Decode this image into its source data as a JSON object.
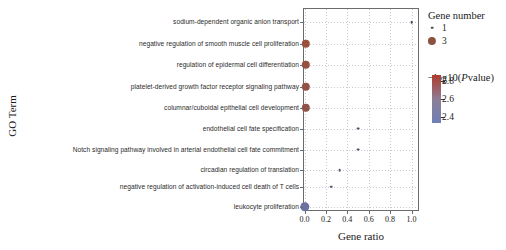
{
  "chart_data": {
    "type": "scatter",
    "title": "",
    "xlabel": "Gene ratio",
    "ylabel": "GO Term",
    "xlim": [
      -0.05,
      1.08
    ],
    "xticks": [
      "0.0",
      "0.2",
      "0.4",
      "0.6",
      "0.8",
      "1.0"
    ],
    "xtickvalues": [
      0.0,
      0.2,
      0.4,
      0.6,
      0.8,
      1.0
    ],
    "grid": true,
    "legend_position": "right",
    "categories": [
      "sodium-dependent organic anion transport",
      "negative regulation of smooth muscle cell proliferation",
      "regulation of epidermal cell differentiation",
      "platelet-derived growth factor receptor signaling pathway",
      "columnar/cuboidal epithelial cell development",
      "endothelial cell fate specification",
      "Notch signaling pathway involved in arterial endothelial cell fate commitment",
      "circadian regulation of translation",
      "negative regulation of activation-induced cell death of T cells",
      "leukocyte proliferation"
    ],
    "points": [
      {
        "category": "sodium-dependent organic anion transport",
        "gene_ratio": 1.0,
        "gene_number": 1,
        "neglog10_pvalue": 2.62,
        "color": "#4a4a55",
        "size": 2.6
      },
      {
        "category": "negative regulation of smooth muscle cell proliferation",
        "gene_ratio": 0.01,
        "gene_number": 3,
        "neglog10_pvalue": 2.8,
        "color": "#9c4f3d",
        "size": 8.4
      },
      {
        "category": "regulation of epidermal cell differentiation",
        "gene_ratio": 0.01,
        "gene_number": 3,
        "neglog10_pvalue": 2.78,
        "color": "#99503f",
        "size": 8.4
      },
      {
        "category": "platelet-derived growth factor receptor signaling pathway",
        "gene_ratio": 0.01,
        "gene_number": 3,
        "neglog10_pvalue": 2.76,
        "color": "#955244",
        "size": 8.4
      },
      {
        "category": "columnar/cuboidal epithelial cell development",
        "gene_ratio": 0.01,
        "gene_number": 3,
        "neglog10_pvalue": 2.74,
        "color": "#8f5349",
        "size": 8.4
      },
      {
        "category": "endothelial cell fate specification",
        "gene_ratio": 0.5,
        "gene_number": 1,
        "neglog10_pvalue": 2.64,
        "color": "#4f4f5e",
        "size": 2.8
      },
      {
        "category": "Notch signaling pathway involved in arterial endothelial cell fate commitment",
        "gene_ratio": 0.5,
        "gene_number": 1,
        "neglog10_pvalue": 2.62,
        "color": "#4f4f5e",
        "size": 2.8
      },
      {
        "category": "circadian regulation of translation",
        "gene_ratio": 0.33,
        "gene_number": 1,
        "neglog10_pvalue": 2.58,
        "color": "#55556a",
        "size": 2.6
      },
      {
        "category": "negative regulation of activation-induced cell death of T cells",
        "gene_ratio": 0.25,
        "gene_number": 1,
        "neglog10_pvalue": 2.52,
        "color": "#5a5a72",
        "size": 2.6
      },
      {
        "category": "leukocyte proliferation",
        "gene_ratio": 0.0,
        "gene_number": 3,
        "neglog10_pvalue": 2.4,
        "color": "#6d6f9e",
        "size": 9.4
      }
    ]
  },
  "legend": {
    "size_title": "Gene number",
    "size_items": [
      {
        "label": "1",
        "px": 2.6,
        "color": "#4a4a55"
      },
      {
        "label": "3",
        "px": 8.2,
        "color": "#8d5140"
      }
    ],
    "color_title_prefix": "−log10(",
    "color_title_italic": "P",
    "color_title_suffix": "value)",
    "color_title_full": "−log10(Pvalue)",
    "colorbar_ticks": [
      "2.8",
      "2.6",
      "2.4"
    ],
    "colorbar_tickvalues": [
      2.8,
      2.6,
      2.4
    ],
    "colorbar_top_color": "#b03a2e",
    "colorbar_mid_color": "#8a7f96",
    "colorbar_bottom_color": "#6f7fb5"
  }
}
